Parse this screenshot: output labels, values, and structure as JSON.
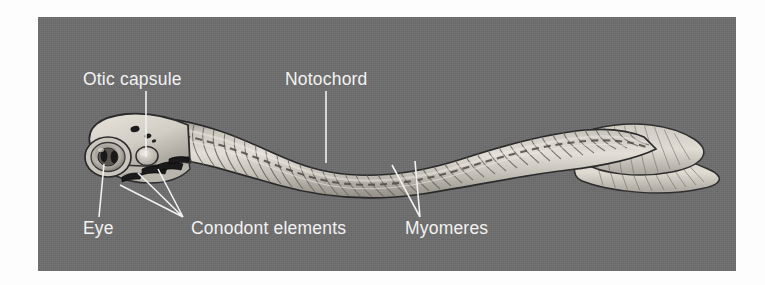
{
  "figure": {
    "kind": "scientific-illustration",
    "panel": {
      "background_color": "#6e6e6e",
      "border_color": "#6e6e6e",
      "outer_background_color": "#fdfdfd"
    },
    "label_color": "#f2f2f2",
    "leader_color": "#f0f0f0"
  },
  "labels": [
    {
      "id": "otic-capsule",
      "text": "Otic capsule",
      "x": 45,
      "y": 68,
      "anchor": "start",
      "leader": "M 108,74 L 108,140"
    },
    {
      "id": "notochord",
      "text": "Notochord",
      "x": 247,
      "y": 68,
      "anchor": "start",
      "leader": "M 288,74 L 288,146"
    },
    {
      "id": "eye",
      "text": "Eye",
      "x": 45,
      "y": 217,
      "anchor": "start",
      "leader": "M 61,200 L 66,147"
    },
    {
      "id": "conodont-elements",
      "text": "Conodont elements",
      "x": 153,
      "y": 217,
      "anchor": "start",
      "leader": "M 145,200 L 82,168 M 145,200 L 100,156 M 145,200 L 120,152"
    },
    {
      "id": "myomeres",
      "text": "Myomeres",
      "x": 367,
      "y": 217,
      "anchor": "start",
      "leader": "M 382,200 L 354,148 M 382,200 L 377,144"
    }
  ],
  "anatomy": {
    "parts": [
      "head",
      "eye",
      "otic-capsule",
      "conodont-elements",
      "notochord",
      "myomeres",
      "trunk",
      "caudal-fin"
    ],
    "body_fill_light": "#d9d5cd",
    "body_fill_mid": "#b4afa6",
    "body_fill_shadow": "#8e8a82",
    "outline_color": "#2b2b2b"
  }
}
